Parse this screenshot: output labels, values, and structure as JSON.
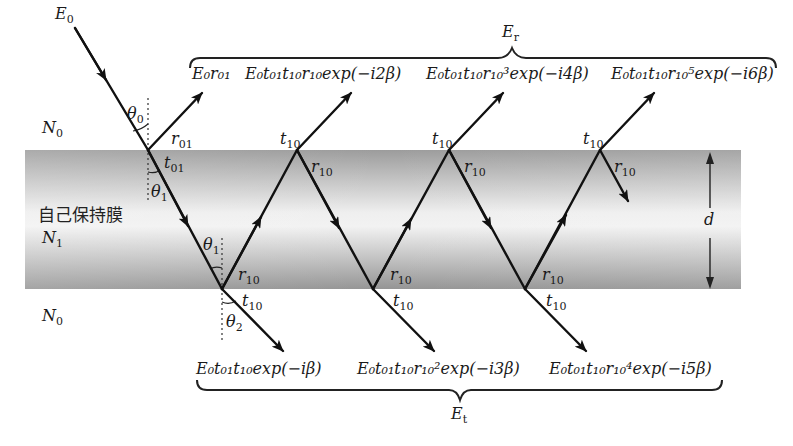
{
  "figure": {
    "type": "thin-film multiple reflection diagram",
    "film": {
      "label": "自己保持膜",
      "index_label": "N",
      "index_sub": "1",
      "thickness_label": "d",
      "fill_edge_color": "#9a9a9a",
      "fill_center_color": "#f2f2f2"
    },
    "media": {
      "top": {
        "label": "N",
        "sub": "0"
      },
      "bottom": {
        "label": "N",
        "sub": "0"
      }
    },
    "incident": {
      "label": "E",
      "sub": "0"
    },
    "angles": {
      "theta0": {
        "label": "θ",
        "sub": "0"
      },
      "theta1_top": {
        "label": "θ",
        "sub": "1"
      },
      "theta1_bottom": {
        "label": "θ",
        "sub": "1"
      },
      "theta2": {
        "label": "θ",
        "sub": "2"
      }
    },
    "coefficients": {
      "r01": {
        "label": "r",
        "sub": "01"
      },
      "t01": {
        "label": "t",
        "sub": "01"
      },
      "t10": {
        "label": "t",
        "sub": "10"
      },
      "r10": {
        "label": "r",
        "sub": "10"
      }
    },
    "reflected_group": {
      "label": "E",
      "sub": "r",
      "terms": [
        {
          "text": "E₀r₀₁"
        },
        {
          "text": "E₀t₀₁t₁₀r₁₀exp(−i2β)"
        },
        {
          "text": "E₀t₀₁t₁₀r₁₀³exp(−i4β)"
        },
        {
          "text": "E₀t₀₁t₁₀r₁₀⁵exp(−i6β)"
        }
      ]
    },
    "transmitted_group": {
      "label": "E",
      "sub": "t",
      "terms": [
        {
          "text": "E₀t₀₁t₁₀exp(−iβ)"
        },
        {
          "text": "E₀t₀₁t₁₀r₁₀²exp(−i3β)"
        },
        {
          "text": "E₀t₀₁t₁₀r₁₀⁴exp(−i5β)"
        }
      ]
    },
    "term_parts": {
      "exp": "exp",
      "neg_i": "(−i",
      "beta_close": "β)",
      "r_t1": {
        "n": "2",
        "close": "β)"
      },
      "r_t2": {
        "n": "4"
      },
      "r_t3": {
        "n": "6"
      },
      "t_t1": {
        "n": ""
      },
      "t_t2": {
        "n": "3"
      },
      "t_t3": {
        "n": "5"
      },
      "pow3": "3",
      "pow5": "5",
      "pow2": "2",
      "pow4": "4"
    }
  }
}
